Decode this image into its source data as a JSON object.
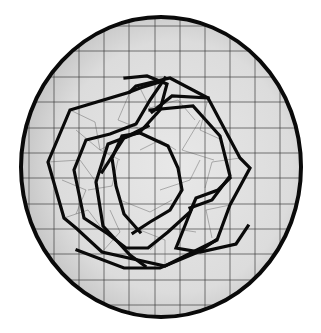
{
  "figure": {
    "colors": {
      "background": "#ffffff",
      "plate_fill_light": "#e6e6e6",
      "plate_fill_dark": "#b8b8b8",
      "rim": "#0a0a0a",
      "grid": "#3a3a3a",
      "knot": "#0a0a0a"
    },
    "plate": {
      "cx": 161,
      "cy": 167,
      "rx": 140,
      "ry": 150,
      "rim_width": 4
    },
    "grid": {
      "x": [
        29,
        54,
        79,
        104,
        129,
        155,
        180,
        205,
        230,
        255,
        280,
        300
      ],
      "y": [
        26,
        51,
        77,
        102,
        128,
        153,
        178,
        204,
        229,
        254,
        280,
        305
      ]
    },
    "knot_paths": [
      "M136,86 L170,78 L208,98 L240,158 L250,168 L230,205 L217,240 L165,266 L102,252 L76,228 L64,218 L48,162 L70,110 L130,92 Z",
      "M130,92 L140,88 L160,82",
      "M216,240 L198,252 L160,268 L124,268 L77,250",
      "M150,110 L193,106 L220,136 L230,176 L212,200 L190,208",
      "M125,78 L147,76 L167,84 L160,110 L140,132 L108,144 L96,182 L103,226 L116,240 L130,255 L145,266",
      "M102,172 L124,138 L148,126",
      "M165,78 L150,100 L136,124 L110,134 L86,140 L74,170 L84,218 L108,234 L126,248 L148,248 L168,232 L190,212 L196,198 L218,190 L230,178",
      "M133,233 L150,222 L170,210 L182,190 L178,168 L168,146 L140,133 L122,136 L112,158 L116,186 L124,214 L140,232",
      "M192,208 L180,238 L176,248 L200,252 L236,244 L248,226",
      "M208,98 L172,96 L152,112"
    ],
    "thin_paths": [
      "M70,110 L95,122 L100,150 L120,160",
      "M48,162 L80,160 L96,182",
      "M64,218 L88,210 L100,226",
      "M140,88 L150,108 L178,100 L195,120",
      "M208,98 L200,130 L222,140",
      "M240,158 L212,162 L205,188",
      "M230,205 L206,210 L212,238",
      "M165,266 L165,240 L140,230",
      "M102,252 L120,232 L110,210",
      "M130,92 L118,120 L138,128",
      "M76,130 L100,150 L118,140",
      "M200,120 L182,150 L214,160",
      "M150,250 L170,228 L196,232",
      "M88,190 L112,186 L118,160",
      "M62,180 L86,190 L76,214",
      "M160,190 L190,180 L200,160",
      "M120,200 L150,212 L172,200",
      "M140,150 L160,140 L176,150"
    ]
  }
}
